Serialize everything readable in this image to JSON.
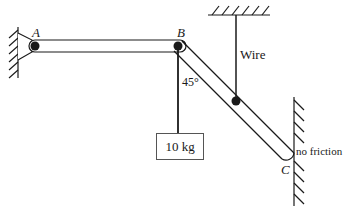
{
  "diagram": {
    "type": "statics-mechanics-diagram",
    "points": {
      "A": {
        "label": "A",
        "description": "pin joint at left wall"
      },
      "B": {
        "label": "B",
        "description": "joint between horizontal and diagonal beams"
      },
      "C": {
        "label": "C",
        "description": "lower end of diagonal beam resting on right wall"
      }
    },
    "labels": {
      "wire": "Wire",
      "angle": "45°",
      "mass": "10 kg",
      "contact": "no friction"
    },
    "colors": {
      "line": "#1a1a1a",
      "box_border": "#555555",
      "background": "#ffffff"
    }
  }
}
